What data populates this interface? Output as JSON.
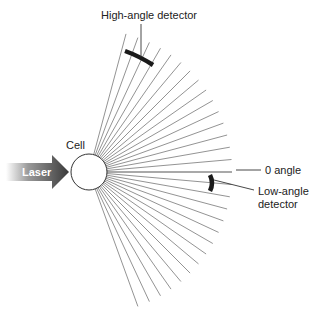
{
  "diagram": {
    "labels": {
      "high_angle_detector": "High-angle detector",
      "cell": "Cell",
      "laser": "Laser",
      "zero_angle": "0 angle",
      "low_angle_line1": "Low-angle",
      "low_angle_line2": "detector"
    },
    "colors": {
      "ray": "#777777",
      "detector": "#1a1a1a",
      "laser_dark": "#3a3a3a",
      "laser_light": "#ffffff",
      "text": "#222222"
    },
    "geometry": {
      "cell_center": [
        89,
        172
      ],
      "cell_radius": 18,
      "ray_start_deg": -75,
      "ray_end_deg": 70,
      "ray_step_deg": 5,
      "ray_length": 143
    }
  }
}
